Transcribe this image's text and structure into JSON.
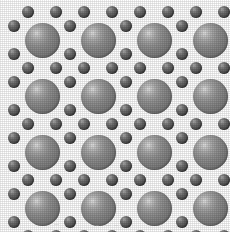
{
  "figure": {
    "background_color": "#ffffff",
    "width": 230,
    "height": 232
  },
  "style": {
    "large_sphere_fill": "#858585",
    "large_sphere_highlight": "#e2e2e2",
    "large_sphere_shadow": "#5f5f5f",
    "small_sphere_fill": "#585858",
    "small_sphere_highlight": "#b4b4b4",
    "small_sphere_shadow": "#3a3a3a",
    "render": "halftone-dither"
  },
  "lattice": {
    "large_sphere_label": "large-atom",
    "small_sphere_label": "small-atom",
    "large_diameter": 35,
    "small_diameter": 12,
    "column_pitch": 56,
    "row_pitch": 56,
    "column_centers": [
      42,
      98,
      154,
      210
    ],
    "row_centers": [
      40,
      96,
      152,
      208
    ],
    "large_rows": 4,
    "large_columns": 4,
    "interstitial_pair_offset_x": 11,
    "interstitial_pair_offset_y": 11,
    "vertical_pair_gap": 28,
    "horizontal_pair_gap": 28
  },
  "artifacts": {
    "bottom_speckles": [
      {
        "x": 54,
        "y": 4,
        "w": 5
      },
      {
        "x": 96,
        "y": 5,
        "w": 3
      },
      {
        "x": 103,
        "y": 5,
        "w": 8
      },
      {
        "x": 114,
        "y": 5,
        "w": 4
      },
      {
        "x": 160,
        "y": 4,
        "w": 3
      },
      {
        "x": 176,
        "y": 6,
        "w": 2
      }
    ]
  }
}
